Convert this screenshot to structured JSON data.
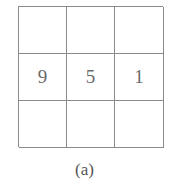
{
  "grid": {
    "rows": 3,
    "cols": 3,
    "cells": [
      [
        "",
        "",
        ""
      ],
      [
        "9",
        "5",
        "1"
      ],
      [
        "",
        "",
        ""
      ]
    ]
  },
  "caption": "(a)"
}
